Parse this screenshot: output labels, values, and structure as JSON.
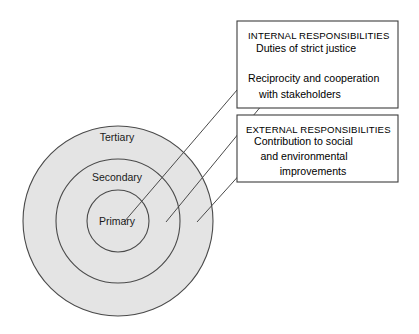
{
  "diagram": {
    "colors": {
      "ring_fill": "#e4e4e4",
      "ring_stroke": "#4a4a4a",
      "box_stroke": "#3d3d3d",
      "leader_stroke": "#4a4a4a",
      "background": "#ffffff",
      "text": "#000000"
    },
    "rings": [
      {
        "id": "tertiary",
        "label": "Tertiary",
        "radius": 95,
        "cx": 118,
        "cy": 221,
        "label_x": 117,
        "label_y": 138
      },
      {
        "id": "secondary",
        "label": "Secondary",
        "radius": 62,
        "cx": 118,
        "cy": 221,
        "label_x": 117,
        "label_y": 178
      },
      {
        "id": "primary",
        "label": "Primary",
        "radius": 31,
        "cx": 118,
        "cy": 221,
        "label_x": 117,
        "label_y": 222
      }
    ],
    "boxes": [
      {
        "id": "internal",
        "heading": "INTERNAL RESPONSIBILITIES",
        "x": 237,
        "y": 21,
        "width": 161,
        "height": 87,
        "lines": [
          {
            "text": "Duties of strict justice",
            "x": 256,
            "y": 48,
            "anchor": "start"
          },
          {
            "text": "Reciprocity and cooperation",
            "x": 248,
            "y": 78,
            "anchor": "start"
          },
          {
            "text": "with stakeholders",
            "x": 259,
            "y": 94,
            "anchor": "start"
          }
        ]
      },
      {
        "id": "external",
        "heading": "EXTERNAL RESPONSIBILITIES",
        "x": 237,
        "y": 115,
        "width": 161,
        "height": 67,
        "lines": [
          {
            "text": "Contribution to social",
            "x": 254,
            "y": 141,
            "anchor": "start"
          },
          {
            "text": "and environmental",
            "x": 304,
            "y": 156,
            "anchor": "middle"
          },
          {
            "text": "improvements",
            "x": 313,
            "y": 171,
            "anchor": "middle"
          }
        ]
      }
    ],
    "leaders": [
      {
        "id": "leader-primary",
        "from_x": 273,
        "from_y": 48,
        "to_x": 124,
        "to_y": 222,
        "target_ring": "primary"
      },
      {
        "id": "leader-secondary",
        "from_x": 271,
        "from_y": 94,
        "to_x": 166,
        "to_y": 222,
        "target_ring": "secondary"
      },
      {
        "id": "leader-tertiary",
        "from_x": 270,
        "from_y": 141,
        "to_x": 197,
        "to_y": 222,
        "target_ring": "tertiary"
      }
    ],
    "heading_positions": [
      {
        "x": 248,
        "y": 36
      },
      {
        "x": 246,
        "y": 130
      }
    ]
  }
}
